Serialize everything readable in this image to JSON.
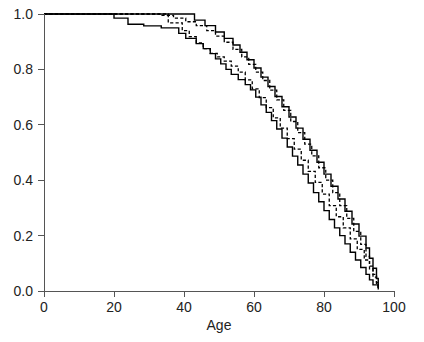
{
  "chart_data": {
    "type": "line",
    "title": "",
    "subtitle": "",
    "xlabel": "Age",
    "ylabel": "",
    "xlim": [
      0,
      100
    ],
    "ylim": [
      0,
      1.0
    ],
    "xticks": [
      0,
      20,
      40,
      60,
      80,
      100
    ],
    "xtick_labels": [
      "0",
      "20",
      "40",
      "60",
      "80",
      "100"
    ],
    "yticks": [
      0.0,
      0.2,
      0.4,
      0.6,
      0.8,
      1.0
    ],
    "ytick_labels": [
      "0.0",
      "0.2",
      "0.4",
      "0.6",
      "0.8",
      "1.0"
    ],
    "grid": false,
    "legend": "none",
    "annotations": [],
    "series": [
      {
        "name": "group-a-solid",
        "style": "solid",
        "color": "#000000",
        "step": "post",
        "x": [
          0,
          19.5,
          20.0,
          23.5,
          24.0,
          28.0,
          28.5,
          33.0,
          33.5,
          38.0,
          38.5,
          40.0,
          40.5,
          43.0,
          43.5,
          45.0,
          45.5,
          47.0,
          47.5,
          48.5,
          49.0,
          50.0,
          50.5,
          51.5,
          52.0,
          53.0,
          53.5,
          55.0,
          55.5,
          57.0,
          57.5,
          58.5,
          59.0,
          60.0,
          60.5,
          61.5,
          62.0,
          63.0,
          63.5,
          64.5,
          65.0,
          66.0,
          66.5,
          67.5,
          68.0,
          69.0,
          69.5,
          70.5,
          71.0,
          72.0,
          72.5,
          73.5,
          74.0,
          75.0,
          75.5,
          76.5,
          77.0,
          78.0,
          78.5,
          79.5,
          80.0,
          81.0,
          81.5,
          82.5,
          83.0,
          84.0,
          84.5,
          85.5,
          86.0,
          87.0,
          87.5,
          88.5,
          89.0,
          90.0,
          90.5,
          91.5,
          92.0,
          93.0,
          94.0,
          95.0,
          95.5
        ],
        "y": [
          1.0,
          1.0,
          0.985,
          0.985,
          0.963,
          0.963,
          0.957,
          0.957,
          0.95,
          0.95,
          0.93,
          0.93,
          0.912,
          0.912,
          0.893,
          0.893,
          0.875,
          0.875,
          0.857,
          0.857,
          0.838,
          0.838,
          0.82,
          0.82,
          0.8,
          0.8,
          0.782,
          0.782,
          0.763,
          0.763,
          0.745,
          0.745,
          0.726,
          0.726,
          0.7,
          0.7,
          0.672,
          0.672,
          0.645,
          0.645,
          0.615,
          0.615,
          0.585,
          0.585,
          0.552,
          0.552,
          0.52,
          0.52,
          0.487,
          0.487,
          0.455,
          0.455,
          0.422,
          0.422,
          0.39,
          0.39,
          0.355,
          0.355,
          0.322,
          0.322,
          0.29,
          0.29,
          0.258,
          0.258,
          0.228,
          0.228,
          0.2,
          0.2,
          0.17,
          0.17,
          0.14,
          0.14,
          0.112,
          0.112,
          0.085,
          0.085,
          0.06,
          0.04,
          0.022,
          0.022,
          0.005
        ]
      },
      {
        "name": "group-a-dashed",
        "style": "dashed",
        "color": "#000000",
        "step": "post",
        "x": [
          0,
          35.0,
          35.5,
          39.0,
          39.5,
          41.0,
          41.5,
          43.0,
          43.5,
          45.0,
          45.5,
          47.0,
          47.5,
          49.0,
          49.5,
          51.0,
          51.5,
          53.0,
          53.5,
          55.0,
          55.5,
          57.0,
          57.5,
          59.0,
          59.5,
          61.0,
          61.5,
          63.0,
          63.5,
          65.0,
          65.5,
          67.0,
          67.5,
          69.0,
          69.5,
          71.0,
          71.5,
          73.0,
          73.5,
          75.0,
          75.5,
          77.0,
          77.5,
          79.0,
          79.5,
          81.0,
          81.5,
          83.0,
          83.5,
          85.0,
          85.5,
          87.0,
          87.5,
          89.0,
          89.5,
          91.0,
          91.5,
          93.0,
          94.0,
          95.0,
          95.5
        ],
        "y": [
          1.0,
          1.0,
          0.968,
          0.968,
          0.94,
          0.94,
          0.918,
          0.918,
          0.896,
          0.896,
          0.875,
          0.875,
          0.858,
          0.858,
          0.845,
          0.845,
          0.83,
          0.83,
          0.812,
          0.812,
          0.79,
          0.79,
          0.762,
          0.762,
          0.73,
          0.73,
          0.698,
          0.698,
          0.662,
          0.662,
          0.625,
          0.625,
          0.588,
          0.588,
          0.55,
          0.55,
          0.512,
          0.512,
          0.472,
          0.472,
          0.432,
          0.432,
          0.392,
          0.392,
          0.35,
          0.35,
          0.308,
          0.308,
          0.268,
          0.268,
          0.228,
          0.228,
          0.188,
          0.188,
          0.15,
          0.15,
          0.112,
          0.08,
          0.05,
          0.028,
          0.008
        ]
      },
      {
        "name": "group-b-dashed",
        "style": "dashed",
        "color": "#000000",
        "step": "post",
        "x": [
          0,
          32.5,
          33.0,
          36.5,
          37.0,
          40.0,
          40.5,
          43.0,
          43.5,
          46.0,
          46.5,
          48.5,
          49.0,
          51.0,
          51.5,
          53.5,
          54.0,
          56.0,
          56.5,
          58.0,
          58.5,
          60.0,
          60.5,
          62.0,
          62.5,
          64.0,
          64.5,
          66.0,
          66.5,
          68.0,
          68.5,
          70.0,
          70.5,
          72.0,
          72.5,
          74.0,
          74.5,
          76.0,
          76.5,
          78.0,
          78.5,
          80.0,
          80.5,
          82.0,
          82.5,
          84.0,
          84.5,
          86.0,
          86.5,
          88.0,
          88.5,
          90.0,
          90.5,
          92.0,
          93.0,
          94.0,
          95.0,
          95.5
        ],
        "y": [
          1.0,
          1.0,
          0.995,
          0.995,
          0.985,
          0.985,
          0.972,
          0.972,
          0.958,
          0.958,
          0.94,
          0.94,
          0.92,
          0.92,
          0.898,
          0.898,
          0.872,
          0.872,
          0.845,
          0.845,
          0.818,
          0.818,
          0.79,
          0.79,
          0.76,
          0.76,
          0.725,
          0.725,
          0.69,
          0.69,
          0.652,
          0.652,
          0.612,
          0.612,
          0.572,
          0.572,
          0.53,
          0.53,
          0.488,
          0.488,
          0.445,
          0.445,
          0.4,
          0.4,
          0.355,
          0.355,
          0.308,
          0.308,
          0.262,
          0.262,
          0.215,
          0.215,
          0.168,
          0.125,
          0.09,
          0.06,
          0.03,
          0.008
        ]
      },
      {
        "name": "group-b-solid",
        "style": "solid",
        "color": "#000000",
        "step": "post",
        "x": [
          0,
          42.5,
          43.0,
          45.5,
          46.0,
          48.5,
          49.0,
          51.0,
          51.5,
          53.5,
          54.0,
          55.5,
          56.0,
          57.5,
          58.0,
          59.5,
          60.0,
          61.5,
          62.0,
          63.5,
          64.0,
          65.5,
          66.0,
          67.5,
          68.0,
          69.5,
          70.0,
          71.5,
          72.0,
          73.5,
          74.0,
          75.5,
          76.0,
          77.5,
          78.0,
          79.5,
          80.0,
          81.5,
          82.0,
          83.5,
          84.0,
          85.5,
          86.0,
          87.5,
          88.0,
          89.5,
          90.0,
          91.5,
          92.0,
          93.0,
          94.0,
          95.0,
          95.5
        ],
        "y": [
          1.0,
          1.0,
          0.978,
          0.978,
          0.958,
          0.958,
          0.935,
          0.935,
          0.912,
          0.912,
          0.888,
          0.888,
          0.862,
          0.862,
          0.835,
          0.835,
          0.805,
          0.805,
          0.772,
          0.772,
          0.738,
          0.738,
          0.702,
          0.702,
          0.665,
          0.665,
          0.628,
          0.628,
          0.588,
          0.588,
          0.548,
          0.548,
          0.508,
          0.508,
          0.465,
          0.465,
          0.422,
          0.422,
          0.378,
          0.378,
          0.332,
          0.332,
          0.288,
          0.288,
          0.242,
          0.242,
          0.198,
          0.198,
          0.155,
          0.118,
          0.082,
          0.045,
          0.012
        ]
      }
    ]
  },
  "axes": {
    "x_title": "Age",
    "y_title": ""
  }
}
